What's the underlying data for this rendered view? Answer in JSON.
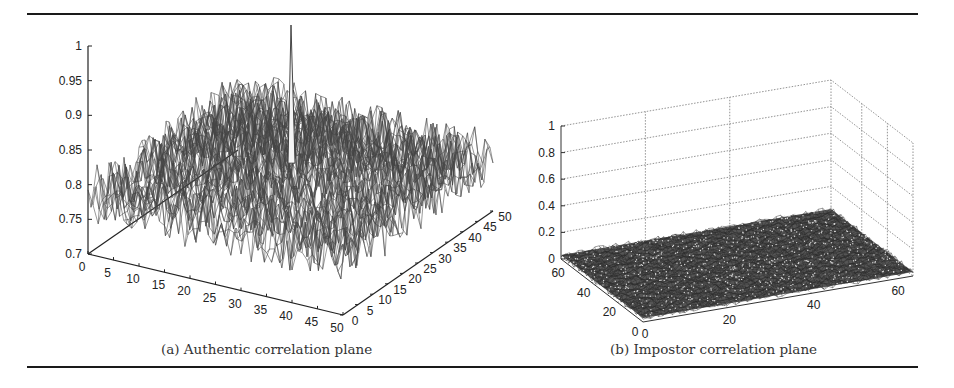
{
  "figure": {
    "captions": {
      "a": "(a) Authentic correlation plane",
      "b": "(b) Impostor correlation plane"
    }
  },
  "chart_data": [
    {
      "id": "a",
      "type": "surface3d",
      "title": "(a) Authentic correlation plane",
      "xlabel": "",
      "ylabel": "",
      "zlabel": "",
      "x_ticks": [
        0,
        5,
        10,
        15,
        20,
        25,
        30,
        35,
        40,
        45,
        50
      ],
      "y_ticks": [
        0,
        5,
        10,
        15,
        20,
        25,
        30,
        35,
        40,
        45,
        50
      ],
      "z_ticks": [
        0.7,
        0.75,
        0.8,
        0.85,
        0.9,
        0.95,
        1
      ],
      "xlim": [
        0,
        50
      ],
      "ylim": [
        0,
        50
      ],
      "zlim": [
        0.7,
        1
      ],
      "grid": false,
      "surface": {
        "baseline": 0.78,
        "noise_amplitude": 0.04,
        "peak": {
          "x": 25,
          "y": 25,
          "z": 1.0
        }
      },
      "description": "Noisy correlation surface around ~0.75-0.85 with a single sharp peak reaching ~1.0 near the center"
    },
    {
      "id": "b",
      "type": "surface3d",
      "title": "(b) Impostor correlation plane",
      "xlabel": "",
      "ylabel": "",
      "zlabel": "",
      "x_ticks": [
        0,
        20,
        40,
        60
      ],
      "y_ticks": [
        0,
        20,
        40,
        60
      ],
      "z_ticks": [
        0,
        0.2,
        0.4,
        0.6,
        0.8,
        1
      ],
      "xlim": [
        0,
        64
      ],
      "ylim": [
        0,
        64
      ],
      "zlim": [
        0,
        1
      ],
      "grid": true,
      "surface": {
        "baseline": 0.03,
        "noise_amplitude": 0.04,
        "peak": null
      },
      "description": "Flat noisy correlation surface near 0 with no distinct peak"
    }
  ]
}
